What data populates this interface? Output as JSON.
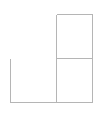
{
  "document": {
    "title": "Wireframe Outline Diagram",
    "background_color": "#ffffff",
    "width": 100,
    "height": 113
  },
  "style": {
    "line_color": "#b5b5b5",
    "line_width": 1,
    "fill_color": "#ffffff"
  },
  "diagram": {
    "type": "line-wireframe",
    "shapes": [
      {
        "name": "left-vertical-edge",
        "kind": "line",
        "x1": 10.5,
        "y1": 58.5,
        "x2": 10.5,
        "y2": 102.5
      },
      {
        "name": "bottom-horizontal-edge",
        "kind": "line",
        "x1": 10.5,
        "y1": 102.5,
        "x2": 92.5,
        "y2": 102.5
      },
      {
        "name": "right-box-top-edge",
        "kind": "line",
        "x1": 56.5,
        "y1": 14.5,
        "x2": 92.5,
        "y2": 14.5
      },
      {
        "name": "right-box-right-edge",
        "kind": "line",
        "x1": 92.5,
        "y1": 14.5,
        "x2": 92.5,
        "y2": 102.5
      },
      {
        "name": "center-vertical-divider",
        "kind": "line",
        "x1": 56.5,
        "y1": 14.5,
        "x2": 56.5,
        "y2": 102.5
      },
      {
        "name": "middle-horizontal-divider",
        "kind": "line",
        "x1": 56.5,
        "y1": 58.5,
        "x2": 92.5,
        "y2": 58.5
      }
    ],
    "regions": [
      {
        "name": "upper-right-cell",
        "x": 57,
        "y": 15,
        "width": 35,
        "height": 43,
        "label": ""
      },
      {
        "name": "lower-right-cell",
        "x": 57,
        "y": 59,
        "width": 35,
        "height": 43,
        "label": ""
      },
      {
        "name": "lower-left-cell",
        "x": 11,
        "y": 59,
        "width": 45,
        "height": 43,
        "label": ""
      }
    ]
  }
}
